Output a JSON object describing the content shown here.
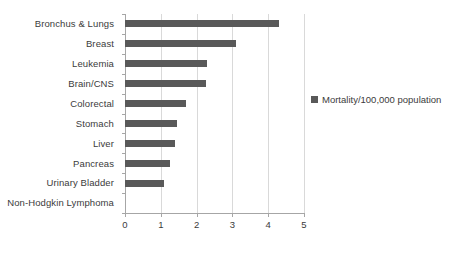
{
  "chart_data": {
    "type": "bar",
    "orientation": "horizontal",
    "title": "",
    "xlabel": "",
    "ylabel": "",
    "xlim": [
      0,
      5
    ],
    "xticks": [
      0,
      1,
      2,
      3,
      4,
      5
    ],
    "grid": true,
    "legend_position": "right",
    "categories": [
      "Bronchus & Lungs",
      "Breast",
      "Leukemia",
      "Brain/CNS",
      "Colorectal",
      "Stomach",
      "Liver",
      "Pancreas",
      "Urinary Bladder",
      "Non-Hodgkin Lymphoma"
    ],
    "series": [
      {
        "name": "Mortality/100,000 population",
        "color": "#595959",
        "values": [
          4.3,
          3.1,
          2.3,
          2.25,
          1.7,
          1.45,
          1.4,
          1.25,
          1.1,
          0
        ]
      }
    ]
  },
  "legend": {
    "entries": [
      {
        "label": "Mortality/100,000 population",
        "color": "#595959"
      }
    ]
  },
  "axis": {
    "x_tick_labels": [
      "0",
      "1",
      "2",
      "3",
      "4",
      "5"
    ]
  }
}
